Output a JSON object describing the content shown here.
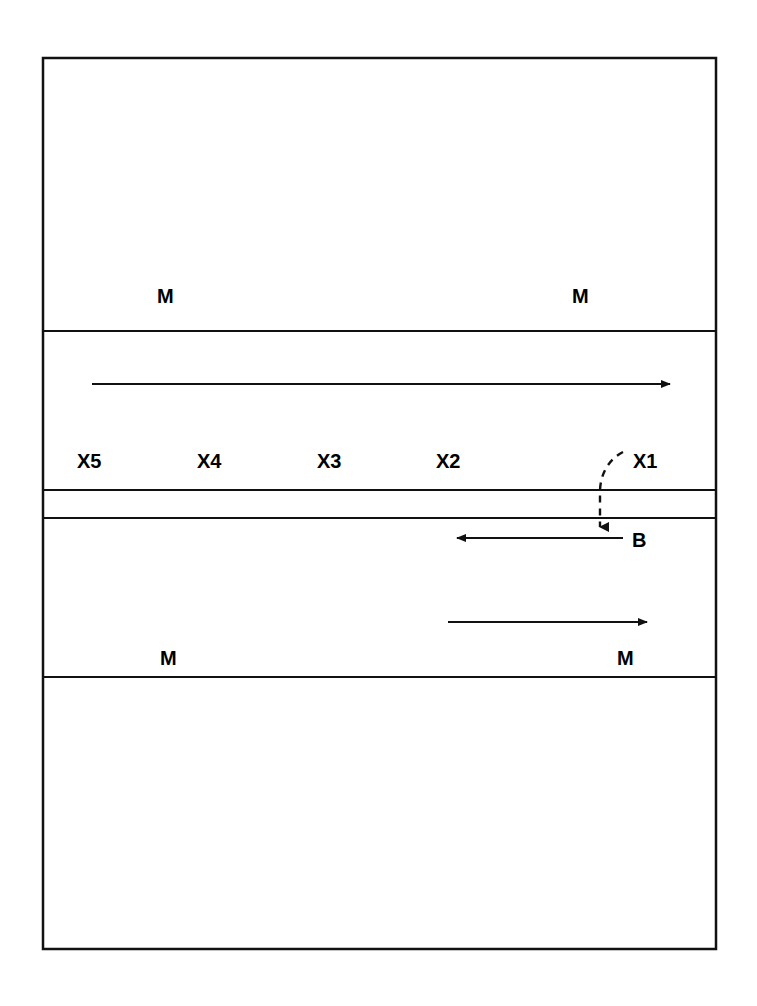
{
  "figure": {
    "title": "",
    "background_color": "#ffffff",
    "stroke_color": "#111111",
    "text_color": "#000000",
    "outer_frame": {
      "x": 43,
      "y": 58,
      "width": 673,
      "height": 891,
      "stroke_width": 2.5
    },
    "horizontal_dividers": [
      {
        "name": "divider-1",
        "y": 331,
        "x1": 43,
        "x2": 716,
        "stroke_width": 2.2
      },
      {
        "name": "divider-2",
        "y": 490,
        "x1": 43,
        "x2": 716,
        "stroke_width": 2.2
      },
      {
        "name": "divider-3",
        "y": 518,
        "x1": 43,
        "x2": 716,
        "stroke_width": 2.2
      },
      {
        "name": "divider-4",
        "y": 677,
        "x1": 43,
        "x2": 716,
        "stroke_width": 2.2
      }
    ],
    "bands": [
      {
        "name": "band-top",
        "top": 58,
        "bottom": 331
      },
      {
        "name": "band-upper-middle",
        "top": 331,
        "bottom": 490
      },
      {
        "name": "band-thin",
        "top": 490,
        "bottom": 518
      },
      {
        "name": "band-lower-middle",
        "top": 518,
        "bottom": 677
      },
      {
        "name": "band-bottom",
        "top": 677,
        "bottom": 949
      }
    ],
    "labels": [
      {
        "name": "m-label-top-left",
        "text": "M",
        "x": 157,
        "y": 303,
        "size": 20
      },
      {
        "name": "m-label-top-right",
        "text": "M",
        "x": 572,
        "y": 303,
        "size": 20
      },
      {
        "name": "x5-label",
        "text": "X5",
        "x": 77,
        "y": 468,
        "size": 20
      },
      {
        "name": "x4-label",
        "text": "X4",
        "x": 197,
        "y": 468,
        "size": 20
      },
      {
        "name": "x3-label",
        "text": "X3",
        "x": 317,
        "y": 468,
        "size": 20
      },
      {
        "name": "x2-label",
        "text": "X2",
        "x": 436,
        "y": 468,
        "size": 20
      },
      {
        "name": "x1-label",
        "text": "X1",
        "x": 633,
        "y": 468,
        "size": 20
      },
      {
        "name": "b-label",
        "text": "B",
        "x": 632,
        "y": 547,
        "size": 20
      },
      {
        "name": "m-label-bottom-left",
        "text": "M",
        "x": 160,
        "y": 665,
        "size": 20
      },
      {
        "name": "m-label-bottom-right",
        "text": "M",
        "x": 617,
        "y": 665,
        "size": 20
      }
    ],
    "arrows": [
      {
        "name": "arrow-upper-rightward",
        "direction": "right",
        "x1": 92,
        "y1": 384,
        "x2": 678,
        "y2": 384,
        "stroke_width": 2.2
      },
      {
        "name": "arrow-lower-leftward",
        "direction": "left",
        "x1": 623,
        "y1": 538,
        "x2": 448,
        "y2": 538,
        "stroke_width": 2.2
      },
      {
        "name": "arrow-lower-rightward",
        "direction": "right",
        "x1": 448,
        "y1": 622,
        "x2": 655,
        "y2": 622,
        "stroke_width": 2.2
      }
    ],
    "dashed_connector": {
      "name": "dashed-curve-x1-to-b",
      "path": "M 623 452 C 609 459, 600 474, 600 492 L 600 528",
      "dash_pattern": "7,6",
      "stroke_width": 2.4,
      "arrowhead": {
        "x": 600,
        "y": 537,
        "direction": "down"
      }
    }
  }
}
